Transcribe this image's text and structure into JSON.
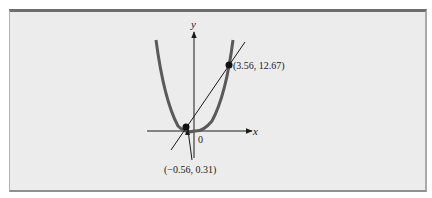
{
  "figure": {
    "axes": {
      "x_label": "x",
      "y_label": "y",
      "origin_label": "0"
    },
    "curves": [
      {
        "name": "parabola",
        "equation": "y = x^2",
        "color": "#5a5a5a"
      },
      {
        "name": "line",
        "color": "#1a1a1a"
      }
    ],
    "points": [
      {
        "label": "(3.56, 12.67)",
        "x": 3.56,
        "y": 12.67
      },
      {
        "label": "(−0.56, 0.31)",
        "x": -0.56,
        "y": 0.31
      }
    ]
  },
  "colors": {
    "background": "#ececec",
    "border": "#6e6e6e",
    "curve": "#5a5a5a",
    "ink": "#1a1a1a"
  }
}
